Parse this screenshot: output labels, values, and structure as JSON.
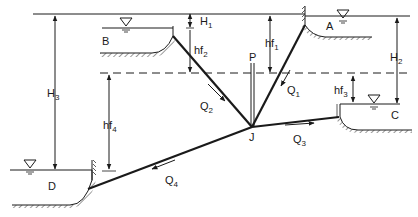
{
  "diagram": {
    "type": "three-reservoir pipe network with pump junction",
    "reservoirs": [
      {
        "id": "A",
        "label": "A"
      },
      {
        "id": "B",
        "label": "B"
      },
      {
        "id": "C",
        "label": "C"
      },
      {
        "id": "D",
        "label": "D"
      }
    ],
    "junction": {
      "label": "J"
    },
    "pump": {
      "label": "P"
    },
    "flows": [
      {
        "label": "Q",
        "sub": "1"
      },
      {
        "label": "Q",
        "sub": "2"
      },
      {
        "label": "Q",
        "sub": "3"
      },
      {
        "label": "Q",
        "sub": "4"
      }
    ],
    "heads": [
      {
        "label": "H",
        "sub": "1"
      },
      {
        "label": "H",
        "sub": "2"
      },
      {
        "label": "H",
        "sub": "3"
      }
    ],
    "head_losses": [
      {
        "label": "hf",
        "sub": "1"
      },
      {
        "label": "hf",
        "sub": "2"
      },
      {
        "label": "hf",
        "sub": "3"
      },
      {
        "label": "hf",
        "sub": "4"
      }
    ],
    "colors": {
      "line": "#1a1a1a",
      "background": "#ffffff"
    }
  }
}
